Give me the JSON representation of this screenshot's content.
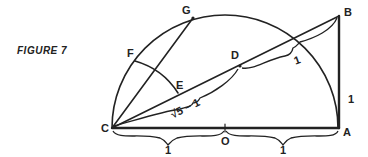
{
  "figure": {
    "caption": "FIGURE 7",
    "ink_color": "#222222",
    "background": "#ffffff"
  },
  "points": {
    "A": {
      "label": "A",
      "x": 339,
      "y": 128
    },
    "B": {
      "label": "B",
      "x": 339,
      "y": 16
    },
    "C": {
      "label": "C",
      "x": 112,
      "y": 128
    },
    "O": {
      "label": "O",
      "x": 225,
      "y": 128
    },
    "D": {
      "label": "D",
      "x": 240,
      "y": 66
    },
    "E": {
      "label": "E",
      "x": 176,
      "y": 95
    },
    "F": {
      "label": "F",
      "x": 135,
      "y": 58
    },
    "G": {
      "label": "G",
      "x": 193,
      "y": 18
    }
  },
  "measures": {
    "CO": "1",
    "OA": "1",
    "AB": "1",
    "DB": "1",
    "CD": "√5 − 1"
  }
}
